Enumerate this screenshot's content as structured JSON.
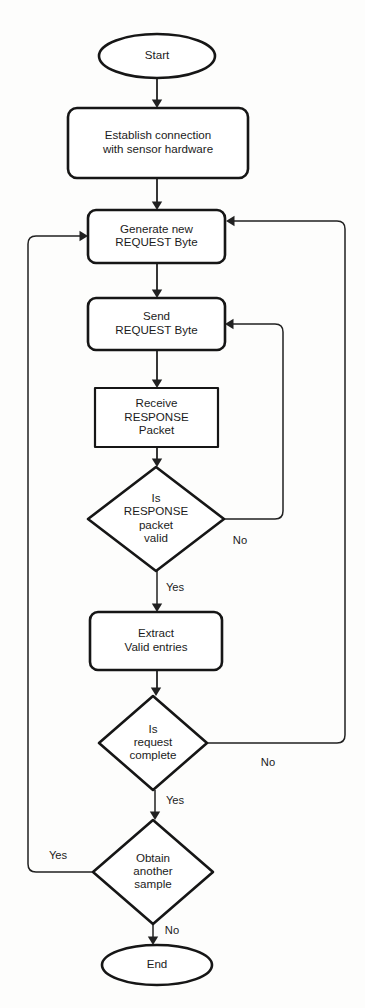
{
  "diagram": {
    "type": "flowchart",
    "colors": {
      "background": "#fdfdfc",
      "shape_fill": "#ffffff",
      "shape_stroke": "#161616",
      "connector_stroke": "#212121",
      "text": "#1b1b1b"
    },
    "nodes": [
      {
        "id": "start",
        "shape": "ellipse",
        "name": "start-terminator",
        "lines": [
          "Start"
        ],
        "cx": 157,
        "cy": 56,
        "rx": 58,
        "ry": 22
      },
      {
        "id": "establish",
        "shape": "rounded-rect",
        "name": "process-establish-connection",
        "lines": [
          "Establish connection",
          "with sensor hardware"
        ],
        "x": 68,
        "y": 108,
        "w": 180,
        "h": 70,
        "r": 9
      },
      {
        "id": "generate",
        "shape": "rounded-rect",
        "name": "process-generate-request-byte",
        "lines": [
          "Generate new",
          "REQUEST Byte"
        ],
        "x": 88,
        "y": 210,
        "w": 137,
        "h": 53,
        "r": 8
      },
      {
        "id": "send",
        "shape": "rounded-rect",
        "name": "process-send-request-byte",
        "lines": [
          "Send",
          "REQUEST Byte"
        ],
        "x": 88,
        "y": 298,
        "w": 137,
        "h": 52,
        "r": 8
      },
      {
        "id": "receive",
        "shape": "rect",
        "name": "process-receive-response-packet",
        "lines": [
          "Receive",
          "RESPONSE",
          "Packet"
        ],
        "x": 95,
        "y": 388,
        "w": 123,
        "h": 59,
        "r": 0
      },
      {
        "id": "valid",
        "shape": "diamond",
        "name": "decision-is-response-packet-valid",
        "lines": [
          "Is",
          "RESPONSE",
          "packet",
          "valid"
        ],
        "cx": 156,
        "cy": 519,
        "rx": 68,
        "ry": 52
      },
      {
        "id": "extract",
        "shape": "rounded-rect",
        "name": "process-extract-valid-entries",
        "lines": [
          "Extract",
          "Valid entries"
        ],
        "x": 90,
        "y": 612,
        "w": 132,
        "h": 58,
        "r": 8
      },
      {
        "id": "complete",
        "shape": "diamond",
        "name": "decision-is-request-complete",
        "lines": [
          "Is",
          "request",
          "complete"
        ],
        "cx": 153,
        "cy": 743,
        "rx": 54,
        "ry": 47
      },
      {
        "id": "another",
        "shape": "diamond",
        "name": "decision-obtain-another-sample",
        "lines": [
          "Obtain",
          "another",
          "sample"
        ],
        "cx": 153,
        "cy": 872,
        "rx": 60,
        "ry": 52
      },
      {
        "id": "end",
        "shape": "ellipse",
        "name": "end-terminator",
        "lines": [
          "End"
        ],
        "cx": 157,
        "cy": 965,
        "rx": 55,
        "ry": 20
      }
    ],
    "edges": [
      {
        "id": "start-to-establish",
        "name": "connector-start-to-establish",
        "from": "start",
        "to": "establish",
        "label": "",
        "path": "M 157 78 L 157 103",
        "arrow": {
          "x": 157,
          "y": 108,
          "dir": "down"
        }
      },
      {
        "id": "establish-to-generate",
        "name": "connector-establish-to-generate",
        "from": "establish",
        "to": "generate",
        "label": "",
        "path": "M 157 178 L 157 205",
        "arrow": {
          "x": 157,
          "y": 210,
          "dir": "down"
        }
      },
      {
        "id": "generate-to-send",
        "name": "connector-generate-to-send",
        "from": "generate",
        "to": "send",
        "label": "",
        "path": "M 157 263 L 157 293",
        "arrow": {
          "x": 157,
          "y": 298,
          "dir": "down"
        }
      },
      {
        "id": "send-to-receive",
        "name": "connector-send-to-receive",
        "from": "send",
        "to": "receive",
        "label": "",
        "path": "M 157 350 L 157 383",
        "arrow": {
          "x": 157,
          "y": 388,
          "dir": "down"
        }
      },
      {
        "id": "receive-to-valid",
        "name": "connector-receive-to-valid",
        "from": "receive",
        "to": "valid",
        "label": "",
        "path": "M 157 447 L 157 462",
        "arrow": {
          "x": 157,
          "y": 467,
          "dir": "down"
        }
      },
      {
        "id": "valid-no-to-send",
        "name": "connector-valid-no-to-send",
        "from": "valid",
        "to": "send",
        "label": "No",
        "label_x": 240,
        "label_y": 541,
        "path": "M 224 519 L 275 519 Q 283 519 283 511 L 283 332 Q 283 324 275 324 L 230 324",
        "arrow": {
          "x": 225,
          "y": 324,
          "dir": "left"
        }
      },
      {
        "id": "valid-yes-to-extract",
        "name": "connector-valid-yes-to-extract",
        "from": "valid",
        "to": "extract",
        "label": "Yes",
        "label_x": 175,
        "label_y": 588,
        "path": "M 157 571 L 157 607",
        "arrow": {
          "x": 157,
          "y": 612,
          "dir": "down"
        }
      },
      {
        "id": "extract-to-complete",
        "name": "connector-extract-to-complete",
        "from": "extract",
        "to": "complete",
        "label": "",
        "path": "M 157 670 L 157 691",
        "arrow": {
          "x": 156,
          "y": 696,
          "dir": "down"
        }
      },
      {
        "id": "complete-no-to-generate",
        "name": "connector-complete-no-to-generate",
        "from": "complete",
        "to": "generate",
        "label": "No",
        "label_x": 268,
        "label_y": 763,
        "path": "M 207 743 L 337 743 Q 345 743 345 735 L 345 229 Q 345 221 337 221 L 232 221",
        "arrow": {
          "x": 226,
          "y": 221,
          "dir": "left"
        }
      },
      {
        "id": "complete-yes-to-another",
        "name": "connector-complete-yes-to-another",
        "from": "complete",
        "to": "another",
        "label": "Yes",
        "label_x": 175,
        "label_y": 801,
        "path": "M 155 790 L 155 815",
        "arrow": {
          "x": 155,
          "y": 820,
          "dir": "down"
        }
      },
      {
        "id": "another-yes-to-generate",
        "name": "connector-another-yes-to-generate",
        "from": "another",
        "to": "generate",
        "label": "Yes",
        "label_x": 58,
        "label_y": 856,
        "path": "M 93 872 L 36 872 Q 28 872 28 864 L 28 244 Q 28 236 36 236 L 82 236",
        "arrow": {
          "x": 88,
          "y": 236,
          "dir": "right"
        }
      },
      {
        "id": "another-no-to-end",
        "name": "connector-another-no-to-end",
        "from": "another",
        "to": "end",
        "label": "No",
        "label_x": 172,
        "label_y": 931,
        "path": "M 153 924 L 153 940",
        "arrow": {
          "x": 153,
          "y": 945,
          "dir": "down"
        }
      }
    ]
  }
}
